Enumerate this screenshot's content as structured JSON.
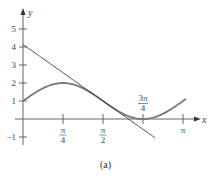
{
  "chart_data": {
    "type": "line",
    "title": "",
    "caption": "(a)",
    "xlabel": "x",
    "ylabel": "y",
    "xlim": [
      0,
      3.4
    ],
    "ylim": [
      -1.3,
      5.5
    ],
    "grid": false,
    "yticks": [
      {
        "value": 5,
        "label": "5"
      },
      {
        "value": 4,
        "label": "4"
      },
      {
        "value": 3,
        "label": "3"
      },
      {
        "value": 2,
        "label": "2"
      },
      {
        "value": 1,
        "label": "1"
      },
      {
        "value": -1,
        "label": "−1"
      }
    ],
    "xticks": [
      {
        "value": 0.7854,
        "num": "π",
        "den": "4"
      },
      {
        "value": 1.5708,
        "num": "π",
        "den": "2"
      },
      {
        "value": 2.3562,
        "num": "3π",
        "den": "4",
        "above": true
      },
      {
        "value": 3.1416,
        "num": "π",
        "den": ""
      }
    ],
    "series": [
      {
        "name": "curve",
        "function": "1 + sin(2x)",
        "x_range": [
          0,
          3.2
        ],
        "color": "#777777",
        "style": "thick"
      },
      {
        "name": "tangent line at x = π/2",
        "function": "1 + π − 2x",
        "x_range": [
          0,
          2.59
        ],
        "color": "#333333",
        "style": "thin"
      }
    ]
  }
}
